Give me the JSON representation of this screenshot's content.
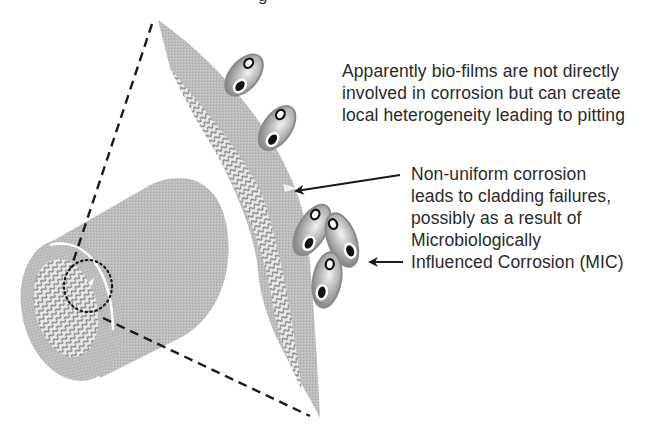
{
  "figure": {
    "title_fragment": "g",
    "colors": {
      "background": "#ffffff",
      "cladding_gray": "#b8b8b8",
      "cladding_dark": "#a9a9a9",
      "hatch": "#8a8a8a",
      "cell_outer": "#8f8f8f",
      "cell_highlight": "#e6e6e6",
      "nucleus": "#111111",
      "line": "#1a1a1a",
      "text": "#2a2a2a"
    }
  },
  "annotations": {
    "biofilm": {
      "lines": [
        "Apparently bio-films are not directly",
        "involved in corrosion but can create",
        "local heterogeneity leading to pitting"
      ]
    },
    "corrosion": {
      "lines": [
        "Non-uniform corrosion",
        "leads to cladding failures,",
        "possibly as a result of",
        "Microbiologically",
        "Influenced Corrosion (MIC)"
      ]
    }
  },
  "arrows": [
    {
      "name": "arrow-to-corrosion-spot",
      "from": [
        400,
        175
      ],
      "to": [
        294,
        191
      ]
    },
    {
      "name": "arrow-to-cell-cluster",
      "from": [
        403,
        262
      ],
      "to": [
        368,
        262
      ]
    }
  ]
}
